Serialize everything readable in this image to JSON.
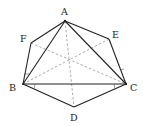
{
  "diagram": {
    "type": "geometry-figure",
    "points": {
      "A": {
        "label": "A",
        "x": 65,
        "y": 21,
        "lx": 62,
        "ly": 15
      },
      "E": {
        "label": "E",
        "x": 109,
        "y": 39,
        "lx": 112,
        "ly": 37
      },
      "C": {
        "label": "C",
        "x": 126,
        "y": 84,
        "lx": 129,
        "ly": 91
      },
      "D": {
        "label": "D",
        "x": 74,
        "y": 107,
        "lx": 71,
        "ly": 120
      },
      "B": {
        "label": "B",
        "x": 23,
        "y": 84,
        "lx": 10,
        "ly": 91
      },
      "F": {
        "label": "F",
        "x": 31,
        "y": 43,
        "lx": 20,
        "ly": 41
      }
    },
    "solid_edges": [
      [
        "A",
        "F"
      ],
      [
        "F",
        "B"
      ],
      [
        "A",
        "E"
      ],
      [
        "E",
        "C"
      ],
      [
        "A",
        "B"
      ],
      [
        "A",
        "C"
      ],
      [
        "B",
        "C"
      ],
      [
        "B",
        "D"
      ],
      [
        "D",
        "C"
      ]
    ],
    "dashed_edges": [
      [
        "A",
        "D"
      ],
      [
        "B",
        "E"
      ],
      [
        "F",
        "C"
      ]
    ],
    "colors": {
      "stroke": "#222222",
      "dashed": "#888888",
      "background": "#ffffff"
    }
  }
}
